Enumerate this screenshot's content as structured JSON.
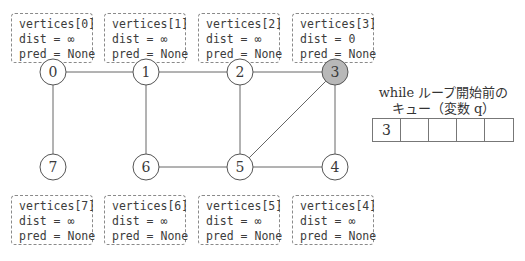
{
  "graph": {
    "nodes": [
      {
        "id": "0",
        "x": 53,
        "y": 72,
        "highlighted": false
      },
      {
        "id": "1",
        "x": 146,
        "y": 72,
        "highlighted": false
      },
      {
        "id": "2",
        "x": 240,
        "y": 72,
        "highlighted": false
      },
      {
        "id": "3",
        "x": 335,
        "y": 72,
        "highlighted": true
      },
      {
        "id": "4",
        "x": 335,
        "y": 167,
        "highlighted": false
      },
      {
        "id": "5",
        "x": 240,
        "y": 167,
        "highlighted": false
      },
      {
        "id": "6",
        "x": 146,
        "y": 167,
        "highlighted": false
      },
      {
        "id": "7",
        "x": 53,
        "y": 167,
        "highlighted": false
      }
    ],
    "edges": [
      [
        "0",
        "1"
      ],
      [
        "1",
        "2"
      ],
      [
        "2",
        "3"
      ],
      [
        "0",
        "7"
      ],
      [
        "1",
        "6"
      ],
      [
        "2",
        "5"
      ],
      [
        "3",
        "5"
      ],
      [
        "3",
        "4"
      ],
      [
        "6",
        "5"
      ],
      [
        "5",
        "4"
      ]
    ],
    "highlight_color": "#b8b8b8"
  },
  "vertices": [
    {
      "title": "vertices[0]",
      "dist": "dist = ∞",
      "pred": "pred = None"
    },
    {
      "title": "vertices[1]",
      "dist": "dist = ∞",
      "pred": "pred = None"
    },
    {
      "title": "vertices[2]",
      "dist": "dist = ∞",
      "pred": "pred = None"
    },
    {
      "title": "vertices[3]",
      "dist": "dist = 0",
      "pred": "pred = None"
    },
    {
      "title": "vertices[4]",
      "dist": "dist = ∞",
      "pred": "pred = None"
    },
    {
      "title": "vertices[5]",
      "dist": "dist = ∞",
      "pred": "pred = None"
    },
    {
      "title": "vertices[6]",
      "dist": "dist = ∞",
      "pred": "pred = None"
    },
    {
      "title": "vertices[7]",
      "dist": "dist = ∞",
      "pred": "pred = None"
    }
  ],
  "queue": {
    "title_line1": "while ループ開始前の",
    "title_line2": "キュー（変数 q）",
    "cells": [
      "3",
      "",
      "",
      "",
      ""
    ]
  }
}
